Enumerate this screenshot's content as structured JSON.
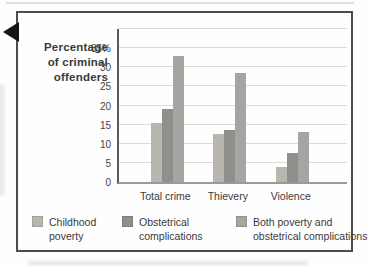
{
  "figure": {
    "ylabel_lines": [
      "Percentage",
      "of criminal",
      "offenders"
    ]
  },
  "chart_data": {
    "type": "bar",
    "title": "",
    "xlabel": "",
    "ylabel": "Percentage of criminal offenders",
    "categories": [
      "Total crime",
      "Thievery",
      "Violence"
    ],
    "series": [
      {
        "name": "Childhood poverty",
        "legend_lines": [
          "Childhood",
          "poverty"
        ],
        "color": "#b9b6b0",
        "values": [
          15.5,
          12.5,
          4
        ]
      },
      {
        "name": "Obstetrical complications",
        "legend_lines": [
          "Obstetrical",
          "complications"
        ],
        "color": "#8f8f8d",
        "values": [
          19,
          13.5,
          7.5
        ]
      },
      {
        "name": "Both poverty and obstetrical complications",
        "legend_lines": [
          "Both poverty and",
          "obstetrical complications"
        ],
        "color": "#a7a5a1",
        "values": [
          33,
          28.5,
          13
        ]
      }
    ],
    "ylim": [
      0,
      40
    ],
    "ytick_step": 5,
    "ytick_labels": [
      "0",
      "5",
      "10",
      "15",
      "20",
      "25",
      "30",
      "35%"
    ],
    "grid": true,
    "legend_position": "bottom"
  },
  "colors": {
    "panel_border": "#4c4c4c",
    "gridline": "#dcdcd9",
    "axis_line": "#5a5a5a",
    "baseline": "#9a9a9a",
    "text": "#3d3d3d",
    "marker": "#161616"
  }
}
